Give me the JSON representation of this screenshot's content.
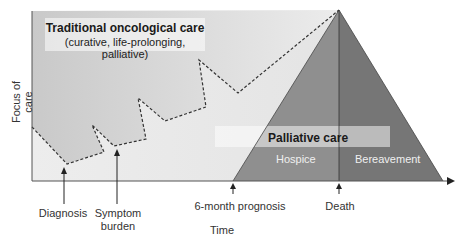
{
  "diagram": {
    "type": "conceptual-care-continuum",
    "y_axis_label": "Focus of care",
    "x_axis_label": "Time",
    "traditional_care": {
      "title": "Traditional oncological care",
      "subtitle": "(curative, life-prolonging, palliative)"
    },
    "palliative_care": {
      "title": "Palliative care",
      "phases": [
        "Hospice",
        "Bereavement"
      ]
    },
    "milestones": [
      {
        "label": "Diagnosis",
        "x": 67
      },
      {
        "label": "Symptom",
        "label2": "burden",
        "x": 114
      },
      {
        "label": "6-month prognosis",
        "x": 233
      },
      {
        "label": "Death",
        "x": 339
      }
    ],
    "colors": {
      "traditional_fill_light": "#e2e2e2",
      "traditional_fill_dark": "#c4c4c4",
      "hospice_fill": "#8f8f8f",
      "bereavement_fill": "#777777",
      "axis": "#555555",
      "band": "#f4f4f4"
    }
  }
}
